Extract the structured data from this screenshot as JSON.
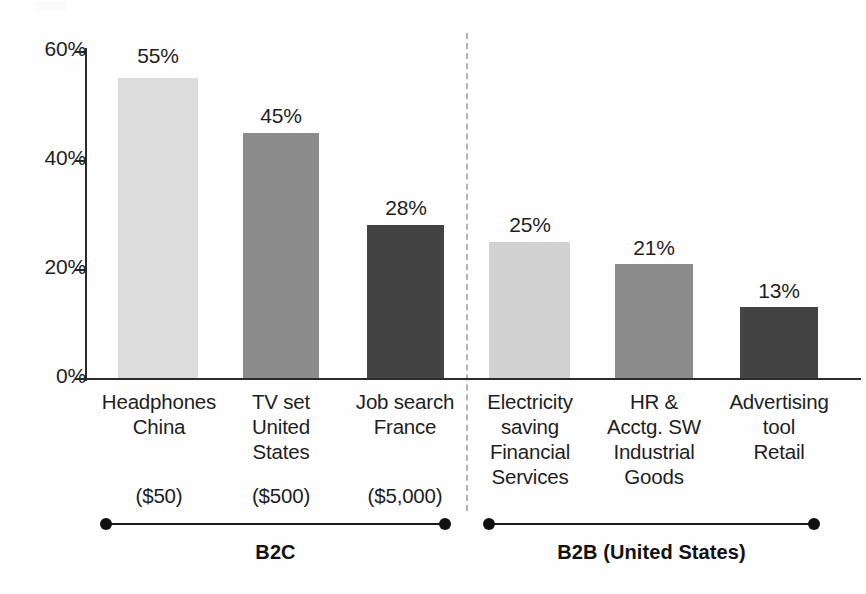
{
  "chart_data": {
    "type": "bar",
    "title": "",
    "subtitle": "",
    "xlabel": "",
    "ylabel": "",
    "ylim": [
      0,
      60
    ],
    "ytick_values": [
      0,
      20,
      40,
      60
    ],
    "ytick_labels": [
      "0%",
      "20%",
      "40%",
      "60%"
    ],
    "grid": false,
    "legend": "none",
    "value_suffix": "%",
    "categories": [
      "Headphones China ($50)",
      "TV set United States ($500)",
      "Job search France ($5,000)",
      "Electricity saving Financial Services",
      "HR & Acctg. SW Industrial Goods",
      "Advertising tool Retail"
    ],
    "values": [
      55,
      45,
      28,
      25,
      21,
      13
    ],
    "value_labels": [
      "55%",
      "45%",
      "28%",
      "25%",
      "21%",
      "13%"
    ],
    "bars": [
      {
        "value": 55,
        "value_label": "55%",
        "shade": "light",
        "color": "#dcdcdc",
        "label_lines": [
          "Headphones",
          "China"
        ],
        "price": "($50)",
        "group": "B2C"
      },
      {
        "value": 45,
        "value_label": "45%",
        "shade": "medium",
        "color": "#8c8c8c",
        "label_lines": [
          "TV set",
          "United",
          "States"
        ],
        "price": "($500)",
        "group": "B2C"
      },
      {
        "value": 28,
        "value_label": "28%",
        "shade": "dark",
        "color": "#434343",
        "label_lines": [
          "Job search",
          "France"
        ],
        "price": "($5,000)",
        "group": "B2C"
      },
      {
        "value": 25,
        "value_label": "25%",
        "shade": "light",
        "color": "#d2d2d2",
        "label_lines": [
          "Electricity",
          "saving",
          "Financial",
          "Services"
        ],
        "price": "",
        "group": "B2B (United States)"
      },
      {
        "value": 21,
        "value_label": "21%",
        "shade": "medium",
        "color": "#8c8c8c",
        "label_lines": [
          "HR &",
          "Acctg. SW",
          "Industrial",
          "Goods"
        ],
        "price": "",
        "group": "B2B (United States)"
      },
      {
        "value": 13,
        "value_label": "13%",
        "shade": "dark",
        "color": "#434343",
        "label_lines": [
          "Advertising",
          "tool",
          "Retail"
        ],
        "price": "",
        "group": "B2B (United States)"
      }
    ],
    "groups": [
      {
        "label": "B2C",
        "bar_indices": [
          0,
          1,
          2
        ]
      },
      {
        "label": "B2B (United States)",
        "bar_indices": [
          3,
          4,
          5
        ]
      }
    ],
    "colors": {
      "light": "#dcdcdc",
      "medium": "#8c8c8c",
      "dark": "#434343",
      "axis": "#2b2b2b",
      "text": "#1e1e1e",
      "divider": "#b4b4b4"
    }
  },
  "axis": {
    "tick_0": "0%",
    "tick_20": "20%",
    "tick_40": "40%",
    "tick_60": "60%"
  },
  "bar_labels": {
    "b0_l0": "Headphones",
    "b0_l1": "China",
    "b0_price": "($50)",
    "b1_l0": "TV set",
    "b1_l1": "United",
    "b1_l2": "States",
    "b1_price": "($500)",
    "b2_l0": "Job search",
    "b2_l1": "France",
    "b2_price": "($5,000)",
    "b3_l0": "Electricity",
    "b3_l1": "saving",
    "b3_l2": "Financial",
    "b3_l3": "Services",
    "b4_l0": "HR &",
    "b4_l1": "Acctg. SW",
    "b4_l2": "Industrial",
    "b4_l3": "Goods",
    "b5_l0": "Advertising",
    "b5_l1": "tool",
    "b5_l2": "Retail"
  },
  "values": {
    "v0": "55%",
    "v1": "45%",
    "v2": "28%",
    "v3": "25%",
    "v4": "21%",
    "v5": "13%"
  },
  "groups": {
    "g0": "B2C",
    "g1": "B2B (United States)"
  }
}
